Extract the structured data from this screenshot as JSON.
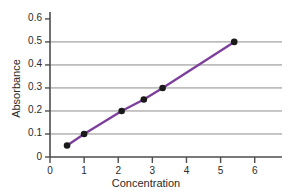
{
  "chart_data": {
    "type": "line",
    "title": "",
    "xlabel": "Concentration",
    "ylabel": "Absorbance",
    "xlim": [
      0,
      6.8
    ],
    "ylim": [
      0,
      0.63
    ],
    "xticks": [
      "0",
      "1",
      "2",
      "3",
      "4",
      "5",
      "6"
    ],
    "xtick_values": [
      0,
      1,
      2,
      3,
      4,
      5,
      6
    ],
    "yticks": [
      "0",
      "0.1",
      "0.2",
      "0.3",
      "0.4",
      "0.5",
      "0.6"
    ],
    "ytick_values": [
      0,
      0.1,
      0.2,
      0.3,
      0.4,
      0.5,
      0.6
    ],
    "grid": "horizontal",
    "gridlines_at": [
      0.1,
      0.2,
      0.3,
      0.4,
      0.5
    ],
    "legend": "none",
    "series": [
      {
        "name": "calibration curve",
        "color": "#7d3f9c",
        "marker": "circle",
        "marker_color": "#1a1a1a",
        "x": [
          0.5,
          1.0,
          2.1,
          2.75,
          3.3,
          5.4
        ],
        "y": [
          0.05,
          0.1,
          0.2,
          0.25,
          0.3,
          0.5
        ]
      }
    ]
  },
  "style": {
    "axis_color": "#4d4d4d",
    "grid_color": "#8c8c8c",
    "text_color": "#2b2b2b",
    "background": "#ffffff",
    "line_color": "#7d3f9c",
    "marker_color": "#1a1a1a"
  }
}
